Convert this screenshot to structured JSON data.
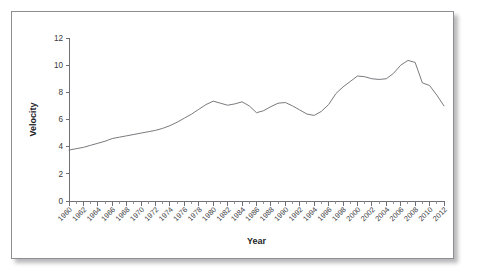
{
  "figure": {
    "background_color": "#ffffff",
    "border_color": "#8d8d92",
    "line_color": "#7a7a7f",
    "axis_color": "#6f6f74",
    "text_color": "#3a3a3e"
  },
  "chart_data": {
    "type": "line",
    "title": "",
    "xlabel": "Year",
    "ylabel": "Velocity",
    "xlim": [
      1960,
      2012
    ],
    "ylim": [
      0,
      12
    ],
    "ytick_values": [
      0,
      2,
      4,
      6,
      8,
      10,
      12
    ],
    "ytick_labels": [
      "0",
      "2",
      "4",
      "6",
      "8",
      "10",
      "12"
    ],
    "xtick_labels": [
      "1960",
      "1962",
      "1964",
      "1966",
      "1968",
      "1970",
      "1972",
      "1974",
      "1976",
      "1978",
      "1980",
      "1982",
      "1984",
      "1986",
      "1988",
      "1990",
      "1992",
      "1994",
      "1996",
      "1998",
      "2000",
      "2002",
      "2004",
      "2006",
      "2008",
      "2010",
      "2012"
    ],
    "xtick_values": [
      1960,
      1962,
      1964,
      1966,
      1968,
      1970,
      1972,
      1974,
      1976,
      1978,
      1980,
      1982,
      1984,
      1986,
      1988,
      1990,
      1992,
      1994,
      1996,
      1998,
      2000,
      2002,
      2004,
      2006,
      2008,
      2010,
      2012
    ],
    "xtick_minor_step": 1,
    "xtick_label_rotation": 45,
    "grid": false,
    "legend": false,
    "x": [
      1960,
      1961,
      1962,
      1963,
      1964,
      1965,
      1966,
      1967,
      1968,
      1969,
      1970,
      1971,
      1972,
      1973,
      1974,
      1975,
      1976,
      1977,
      1978,
      1979,
      1980,
      1981,
      1982,
      1983,
      1984,
      1985,
      1986,
      1987,
      1988,
      1989,
      1990,
      1991,
      1992,
      1993,
      1994,
      1995,
      1996,
      1997,
      1998,
      1999,
      2000,
      2001,
      2002,
      2003,
      2004,
      2005,
      2006,
      2007,
      2008,
      2009,
      2010,
      2011,
      2012
    ],
    "values": [
      3.75,
      3.85,
      3.95,
      4.1,
      4.25,
      4.4,
      4.6,
      4.7,
      4.8,
      4.9,
      5.0,
      5.1,
      5.2,
      5.35,
      5.55,
      5.8,
      6.1,
      6.4,
      6.75,
      7.1,
      7.35,
      7.2,
      7.05,
      7.15,
      7.3,
      7.0,
      6.5,
      6.65,
      6.95,
      7.2,
      7.25,
      7.0,
      6.7,
      6.4,
      6.3,
      6.6,
      7.1,
      7.9,
      8.4,
      8.8,
      9.2,
      9.15,
      9.0,
      8.95,
      9.0,
      9.4,
      10.0,
      10.35,
      10.2,
      8.7,
      8.5,
      7.8,
      7.0
    ]
  }
}
